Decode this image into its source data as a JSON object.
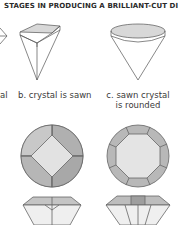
{
  "title": "STAGES IN PRODUCING A BRILLIANT-CUT DIAMOND.",
  "stages": [
    {
      "label": "a. crystal",
      "visible_fragment": "al"
    },
    {
      "label": "b. crystal is sawn"
    },
    {
      "label_line1": "c. sawn crystal",
      "label_line2": "is rounded"
    }
  ],
  "views": [
    "side view of crystal",
    "top view of cut facets",
    "side view of cut diamond"
  ],
  "colors": {
    "line": "#555555",
    "facet_light": "#e4e4e4",
    "facet_mid": "#bdbdbd",
    "facet_dark": "#a6a6a6",
    "table_fill": "#d8d8d8"
  }
}
